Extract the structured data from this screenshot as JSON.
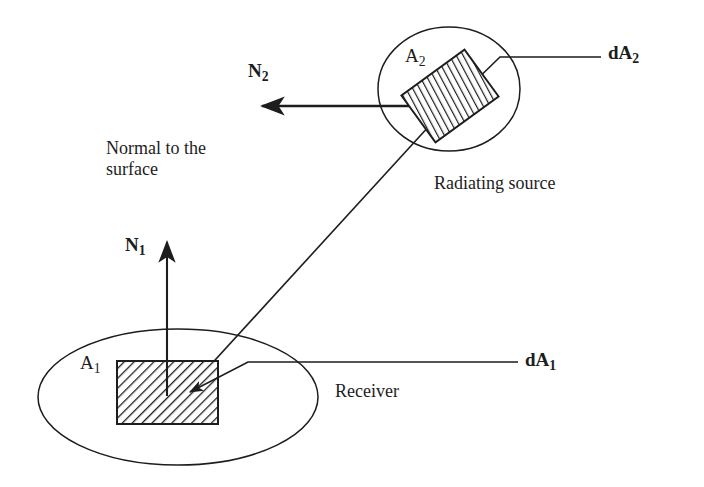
{
  "diagram": {
    "stroke_color": "#1d1d1d",
    "background_color": "#ffffff",
    "labels": {
      "normal_to_surface_line1": "Normal to the",
      "normal_to_surface_line2": "surface",
      "radiating_source": "Radiating source",
      "receiver": "Receiver",
      "n1_base": "N",
      "n1_sub": "1",
      "n2_base": "N",
      "n2_sub": "2",
      "a1_base": "A",
      "a1_sub": "1",
      "a2_base": "A",
      "a2_sub": "2",
      "da1_base": "dA",
      "da1_sub": "1",
      "da2_base": "dA",
      "da2_sub": "2"
    },
    "shapes": {
      "source_ellipse": {
        "cx": 449,
        "cy": 89,
        "rx": 71,
        "ry": 62
      },
      "receiver_ellipse": {
        "cx": 178,
        "cy": 397,
        "rx": 140,
        "ry": 68
      },
      "source_patch_label": "dA2-rotated-hatched-parallelogram",
      "receiver_patch_label": "dA1-hatched-rectangle",
      "receiver_patch": {
        "x": 117,
        "y": 361,
        "w": 101,
        "h": 63
      }
    },
    "vectors": {
      "n1": {
        "from_x": 167,
        "from_y": 396,
        "to_x": 167,
        "to_y": 238,
        "direction": "up"
      },
      "n2": {
        "from_x": 452,
        "from_y": 106,
        "to_x": 258,
        "to_y": 106,
        "direction": "left"
      },
      "ray": {
        "from_x": 452,
        "from_y": 103,
        "to_x": 183,
        "to_y": 394
      }
    }
  }
}
